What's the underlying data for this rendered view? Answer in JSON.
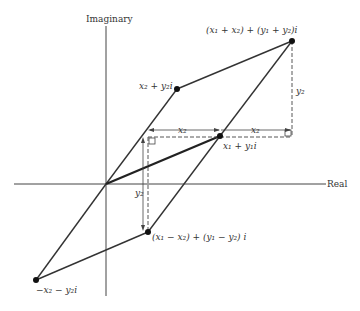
{
  "diagram": {
    "axes": {
      "vertical_label": "Imaginary",
      "horizontal_label": "Real"
    },
    "points": {
      "z1": {
        "label": "x₁ + y₁i",
        "px": [
          220,
          136
        ]
      },
      "z2": {
        "label": "x₂ + y₂i",
        "px": [
          177,
          89
        ]
      },
      "sum": {
        "label": "(x₁ + x₂) + (y₁ + y₂)i",
        "px": [
          292,
          41
        ]
      },
      "difference": {
        "label": "(x₁ − x₂) + (y₁ − y₂) i",
        "px": [
          148,
          232
        ]
      },
      "neg_z2": {
        "label": "−x₂ − y₂i",
        "px": [
          36,
          280
        ]
      }
    },
    "annotations": {
      "x2_left": "x₂",
      "x2_right": "x₂",
      "y2_right": "y₂",
      "y2_lower": "y₂"
    },
    "colors": {
      "line": "#333333",
      "background": "#ffffff"
    }
  }
}
